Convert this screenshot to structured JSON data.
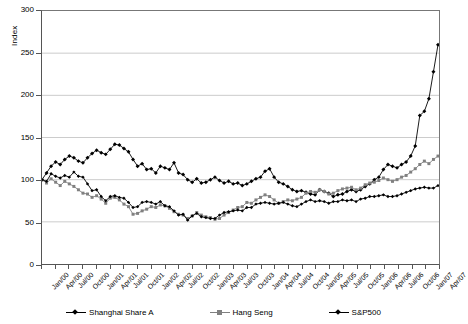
{
  "chart_data": {
    "type": "line",
    "title": "",
    "xlabel": "",
    "ylabel": "Index",
    "ylim": [
      0,
      300
    ],
    "ytick_step": 50,
    "yticks": [
      0,
      50,
      100,
      150,
      200,
      250,
      300
    ],
    "grid": true,
    "grid_axis": "y",
    "legend_position": "bottom",
    "x": [
      "Jan/00",
      "Feb/00",
      "Mar/00",
      "Apr/00",
      "May/00",
      "Jun/00",
      "Jul/00",
      "Aug/00",
      "Sep/00",
      "Oct/00",
      "Nov/00",
      "Dec/00",
      "Jan/01",
      "Feb/01",
      "Mar/01",
      "Apr/01",
      "May/01",
      "Jun/01",
      "Jul/01",
      "Aug/01",
      "Sep/01",
      "Oct/01",
      "Nov/01",
      "Dec/01",
      "Jan/02",
      "Feb/02",
      "Mar/02",
      "Apr/02",
      "May/02",
      "Jun/02",
      "Jul/02",
      "Aug/02",
      "Sep/02",
      "Oct/02",
      "Nov/02",
      "Dec/02",
      "Jan/03",
      "Feb/03",
      "Mar/03",
      "Apr/03",
      "May/03",
      "Jun/03",
      "Jul/03",
      "Aug/03",
      "Sep/03",
      "Oct/03",
      "Nov/03",
      "Dec/03",
      "Jan/04",
      "Feb/04",
      "Mar/04",
      "Apr/04",
      "May/04",
      "Jun/04",
      "Jul/04",
      "Aug/04",
      "Sep/04",
      "Oct/04",
      "Nov/04",
      "Dec/04",
      "Jan/05",
      "Feb/05",
      "Mar/05",
      "Apr/05",
      "May/05",
      "Jun/05",
      "Jul/05",
      "Aug/05",
      "Sep/05",
      "Oct/05",
      "Nov/05",
      "Dec/05",
      "Jan/06",
      "Feb/06",
      "Mar/06",
      "Apr/06",
      "May/06",
      "Jun/06",
      "Jul/06",
      "Aug/06",
      "Sep/06",
      "Oct/06",
      "Nov/06",
      "Dec/06",
      "Jan/07",
      "Feb/07",
      "Mar/07",
      "Apr/07"
    ],
    "xtick_labels": [
      "Jan/00",
      "Apr/00",
      "Jul/00",
      "Oct/00",
      "Jan/01",
      "Apr/01",
      "Jul/01",
      "Oct/01",
      "Jan/02",
      "Apr/02",
      "Jul/02",
      "Oct/02",
      "Jan/03",
      "Apr/03",
      "Jul/03",
      "Oct/03",
      "Jan/04",
      "Apr/04",
      "Jul/04",
      "Oct/04",
      "Jan/05",
      "Apr/05",
      "Jul/05",
      "Oct/05",
      "Jan/06",
      "Apr/06",
      "Jul/06",
      "Oct/06",
      "Jan/07",
      "Apr/07"
    ],
    "series": [
      {
        "name": "Shanghai Share A",
        "color": "#000000",
        "marker": "diamond",
        "values": [
          100,
          108,
          116,
          121,
          118,
          124,
          128,
          126,
          122,
          120,
          126,
          131,
          135,
          132,
          130,
          136,
          142,
          141,
          137,
          133,
          124,
          116,
          119,
          112,
          113,
          108,
          116,
          114,
          112,
          120,
          108,
          106,
          100,
          97,
          101,
          96,
          97,
          100,
          103,
          99,
          96,
          98,
          95,
          96,
          93,
          95,
          98,
          101,
          103,
          110,
          113,
          103,
          97,
          95,
          92,
          88,
          86,
          87,
          85,
          83,
          82,
          88,
          86,
          84,
          80,
          82,
          83,
          86,
          88,
          86,
          88,
          92,
          95,
          100,
          103,
          112,
          118,
          116,
          114,
          118,
          121,
          128,
          140,
          176,
          181,
          196,
          228,
          260
        ]
      },
      {
        "name": "Hang Seng",
        "color": "#808080",
        "marker": "square",
        "values": [
          100,
          96,
          101,
          97,
          93,
          98,
          95,
          92,
          88,
          84,
          83,
          79,
          81,
          77,
          72,
          78,
          79,
          76,
          71,
          68,
          59,
          60,
          63,
          65,
          68,
          67,
          70,
          69,
          66,
          62,
          59,
          58,
          54,
          57,
          61,
          58,
          56,
          55,
          53,
          54,
          58,
          61,
          64,
          67,
          68,
          73,
          72,
          76,
          79,
          82,
          80,
          76,
          72,
          74,
          76,
          75,
          77,
          79,
          84,
          86,
          85,
          88,
          86,
          83,
          84,
          87,
          89,
          90,
          91,
          88,
          90,
          94,
          96,
          97,
          99,
          102,
          100,
          98,
          100,
          103,
          105,
          109,
          113,
          118,
          122,
          119,
          124,
          128
        ]
      },
      {
        "name": "S&P500",
        "color": "#000000",
        "marker": "diamond-small",
        "values": [
          100,
          98,
          107,
          104,
          102,
          105,
          103,
          109,
          104,
          103,
          95,
          87,
          88,
          80,
          75,
          80,
          81,
          79,
          78,
          73,
          67,
          68,
          73,
          74,
          73,
          71,
          74,
          69,
          68,
          63,
          58,
          59,
          52,
          57,
          60,
          56,
          55,
          54,
          54,
          58,
          61,
          62,
          63,
          64,
          63,
          67,
          67,
          71,
          72,
          73,
          72,
          71,
          72,
          73,
          71,
          69,
          68,
          71,
          74,
          76,
          74,
          75,
          74,
          72,
          74,
          74,
          76,
          75,
          76,
          74,
          77,
          78,
          80,
          80,
          81,
          82,
          80,
          80,
          81,
          83,
          85,
          87,
          89,
          90,
          91,
          90,
          90,
          93
        ]
      }
    ]
  },
  "axis": {
    "y_label": "Index"
  }
}
